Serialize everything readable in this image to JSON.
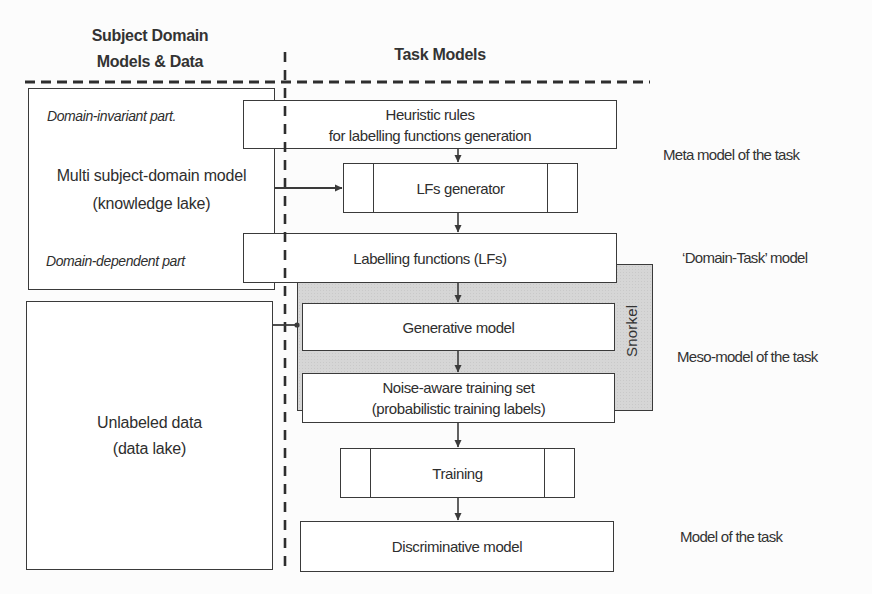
{
  "headers": {
    "left_line1": "Subject Domain",
    "left_line2": "Models & Data",
    "right": "Task Models"
  },
  "left_column": {
    "knowledge_box": {
      "top_note": "Domain-invariant part.",
      "title": "Multi subject-domain model",
      "subtitle": "(knowledge lake)",
      "bottom_note": "Domain-dependent part"
    },
    "data_box": {
      "title": "Unlabeled data",
      "subtitle": "(data lake)"
    }
  },
  "task_column": {
    "heuristic": {
      "line1": "Heuristic rules",
      "line2": "for labelling functions generation"
    },
    "lf_generator": {
      "label": "LFs generator"
    },
    "labelling_functions": {
      "label": "Labelling functions (LFs)"
    },
    "snorkel": {
      "label": "Snorkel"
    },
    "generative": {
      "label": "Generative model"
    },
    "noise_aware": {
      "line1": "Noise-aware training set",
      "line2": "(probabilistic training labels)"
    },
    "training": {
      "label": "Training"
    },
    "discriminative": {
      "label": "Discriminative model"
    }
  },
  "levels": [
    {
      "label": "Meta model of the task"
    },
    {
      "label": "‘Domain-Task’ model"
    },
    {
      "label": "Meso-model of the task"
    },
    {
      "label": "Model of the task"
    }
  ],
  "colors": {
    "ink": "#3a3a3a",
    "text": "#2e2e2e",
    "paper": "#fcfcfc",
    "snorkel-fill": "#d6d6d6",
    "box-fill": "#ffffff"
  }
}
